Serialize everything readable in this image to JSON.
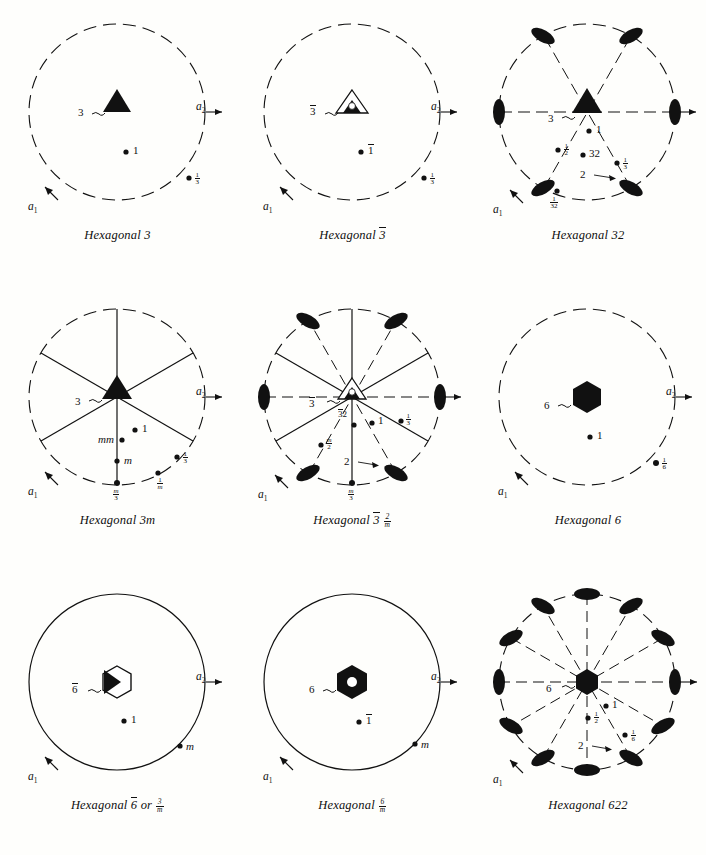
{
  "figure": {
    "background_color": "#fefefc",
    "ink_color": "#111111",
    "axis_labels": {
      "a1": "a",
      "a1_sub": "1",
      "a2": "a",
      "a2_sub": "2"
    }
  },
  "diagrams": [
    {
      "id": "hexagonal-3",
      "caption_prefix": "Hexagonal",
      "caption_symbol": "3",
      "caption_full": "Hexagonal 3",
      "circle_style": "dashed",
      "center_symbol": "filled-triangle",
      "center_symbol_label": "3",
      "radial_lines": 0,
      "lens_count": 0,
      "general_points": [
        {
          "label": "1",
          "kind": "plain"
        },
        {
          "label": "1/3",
          "kind": "fraction",
          "num": "1",
          "den": "3"
        }
      ]
    },
    {
      "id": "hexagonal-3bar",
      "caption_prefix": "Hexagonal",
      "caption_symbol": "3̅",
      "caption_full": "Hexagonal 3-bar",
      "circle_style": "dashed",
      "center_symbol": "triangle-with-hole",
      "center_symbol_label": "3̅",
      "radial_lines": 0,
      "lens_count": 0,
      "general_points": [
        {
          "label": "1̅",
          "kind": "overbar"
        },
        {
          "label": "1/3",
          "kind": "fraction",
          "num": "1",
          "den": "3"
        }
      ]
    },
    {
      "id": "hexagonal-32",
      "caption_prefix": "Hexagonal",
      "caption_symbol": "32",
      "caption_full": "Hexagonal 32",
      "circle_style": "dashed",
      "center_symbol": "filled-triangle",
      "center_symbol_label": "3",
      "radial_lines": 3,
      "radial_style": "dashed",
      "lens_count": 6,
      "lens_label": "2",
      "general_points": [
        {
          "label": "1",
          "kind": "plain"
        },
        {
          "label": "1/2",
          "kind": "fraction",
          "num": "1",
          "den": "2"
        },
        {
          "label": "32",
          "kind": "plain"
        },
        {
          "label": "1/3",
          "kind": "fraction",
          "num": "1",
          "den": "3"
        },
        {
          "label": "1/32",
          "kind": "fraction",
          "num": "1",
          "den": "32"
        }
      ]
    },
    {
      "id": "hexagonal-3m",
      "caption_prefix": "Hexagonal",
      "caption_symbol": "3m",
      "caption_full": "Hexagonal 3m",
      "circle_style": "dashed",
      "center_symbol": "filled-triangle",
      "center_symbol_label": "3",
      "radial_lines": 3,
      "radial_style": "solid",
      "lens_count": 0,
      "general_points": [
        {
          "label": "1",
          "kind": "plain"
        },
        {
          "label": "mm",
          "kind": "italic"
        },
        {
          "label": "m",
          "kind": "italic"
        },
        {
          "label": "1/3",
          "kind": "fraction",
          "num": "1",
          "den": "3"
        },
        {
          "label": "1/m",
          "kind": "fraction",
          "num": "1",
          "den": "m"
        },
        {
          "label": "m/3",
          "kind": "fraction",
          "num": "m",
          "den": "3"
        }
      ]
    },
    {
      "id": "hexagonal-3bar-2-over-m",
      "caption_prefix": "Hexagonal",
      "caption_symbol": "3̅ 2/m",
      "caption_full": "Hexagonal 3-bar 2/m",
      "caption_frac_num": "2",
      "caption_frac_den": "m",
      "circle_style": "dashed",
      "center_symbol": "triangle-with-hole",
      "center_symbol_label": "3̅",
      "radial_lines": 6,
      "radial_style": "mixed",
      "lens_count": 6,
      "lens_label": "2",
      "general_points": [
        {
          "label": "3̅2",
          "kind": "overbar-pair"
        },
        {
          "label": "1",
          "kind": "plain"
        },
        {
          "label": "1/3",
          "kind": "fraction",
          "num": "1",
          "den": "3"
        },
        {
          "label": "m/2",
          "kind": "fraction",
          "num": "m",
          "den": "2"
        },
        {
          "label": "m/3",
          "kind": "fraction",
          "num": "m",
          "den": "3"
        }
      ]
    },
    {
      "id": "hexagonal-6",
      "caption_prefix": "Hexagonal",
      "caption_symbol": "6",
      "caption_full": "Hexagonal 6",
      "circle_style": "dashed",
      "center_symbol": "filled-hexagon",
      "center_symbol_label": "6",
      "radial_lines": 0,
      "lens_count": 0,
      "general_points": [
        {
          "label": "1",
          "kind": "plain"
        },
        {
          "label": "1/6",
          "kind": "fraction",
          "num": "1",
          "den": "6"
        }
      ]
    },
    {
      "id": "hexagonal-6bar",
      "caption_prefix": "Hexagonal",
      "caption_symbol": "6̅ or 3/m",
      "caption_full": "Hexagonal 6-bar or 3/m",
      "caption_frac_num": "3",
      "caption_frac_den": "m",
      "caption_conjunction": "or",
      "circle_style": "solid",
      "center_symbol": "hexagon-outline-with-triangle",
      "center_symbol_label": "6̅",
      "radial_lines": 0,
      "lens_count": 0,
      "general_points": [
        {
          "label": "1",
          "kind": "plain"
        },
        {
          "label": "m",
          "kind": "italic"
        }
      ]
    },
    {
      "id": "hexagonal-6-over-m",
      "caption_prefix": "Hexagonal",
      "caption_symbol": "6/m",
      "caption_full": "Hexagonal 6/m",
      "caption_frac_num": "6",
      "caption_frac_den": "m",
      "circle_style": "solid",
      "center_symbol": "filled-hexagon-with-hole",
      "center_symbol_label": "6",
      "radial_lines": 0,
      "lens_count": 0,
      "general_points": [
        {
          "label": "1̅",
          "kind": "overbar"
        },
        {
          "label": "m",
          "kind": "italic"
        }
      ]
    },
    {
      "id": "hexagonal-622",
      "caption_prefix": "Hexagonal",
      "caption_symbol": "622",
      "caption_full": "Hexagonal 622",
      "circle_style": "dashed",
      "center_symbol": "filled-hexagon",
      "center_symbol_label": "6",
      "radial_lines": 6,
      "radial_style": "dashed",
      "lens_count": 12,
      "lens_label": "2",
      "general_points": [
        {
          "label": "1",
          "kind": "plain"
        },
        {
          "label": "1/2",
          "kind": "fraction",
          "num": "1",
          "den": "2"
        },
        {
          "label": "1/6",
          "kind": "fraction",
          "num": "1",
          "den": "6"
        }
      ]
    }
  ]
}
